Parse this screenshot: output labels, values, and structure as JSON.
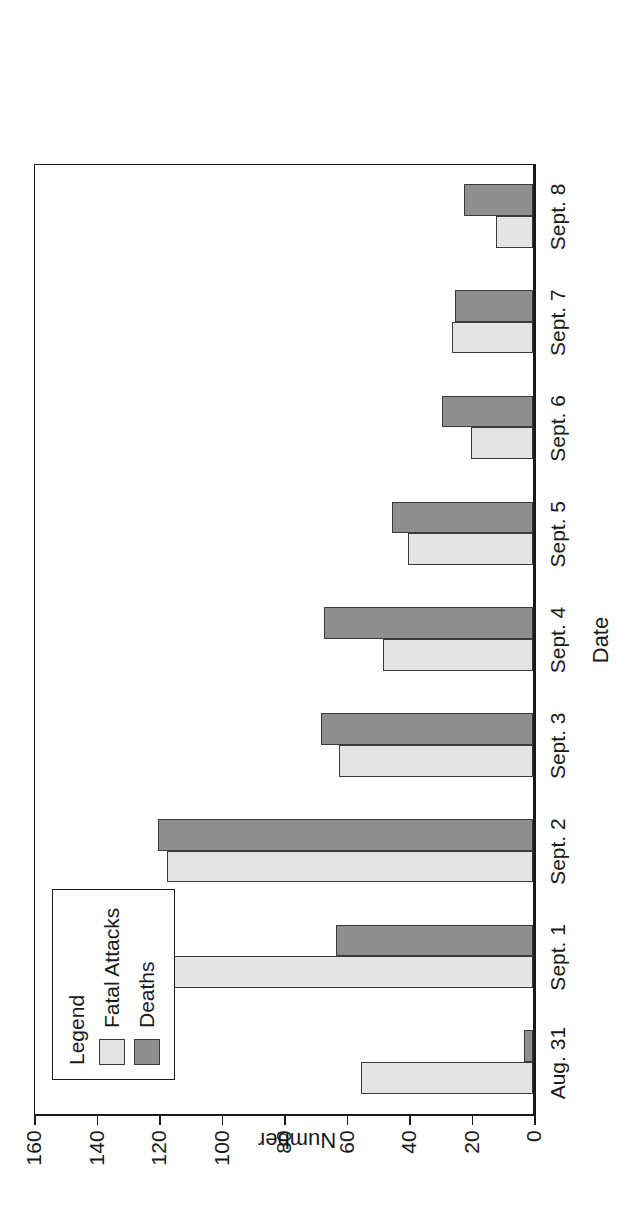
{
  "chart_data": {
    "type": "bar",
    "orientation": "vertical-grouped-rotated",
    "title": "",
    "xlabel": "Date",
    "ylabel": "Number",
    "ylim": [
      0,
      160
    ],
    "yticks": [
      0,
      20,
      40,
      60,
      80,
      100,
      120,
      140,
      160
    ],
    "ytick_labels": [
      "0",
      "20",
      "40",
      "60",
      "80",
      "100",
      "120",
      "140",
      "160"
    ],
    "grid": false,
    "legend_position": "top-left",
    "categories": [
      "Aug. 31",
      "Sept. 1",
      "Sept. 2",
      "Sept. 3",
      "Sept. 4",
      "Sept. 5",
      "Sept. 6",
      "Sept. 7",
      "Sept. 8"
    ],
    "series": [
      {
        "name": "Fatal Attacks",
        "color": "#e4e4e4",
        "values": [
          55,
          140,
          117,
          62,
          48,
          40,
          20,
          26,
          12
        ]
      },
      {
        "name": "Deaths",
        "color": "#8e8e8e",
        "values": [
          3,
          63,
          120,
          68,
          67,
          45,
          29,
          25,
          22
        ]
      }
    ]
  },
  "legend": {
    "title": "Legend",
    "entries": [
      {
        "label": "Fatal Attacks",
        "color": "#e4e4e4"
      },
      {
        "label": "Deaths",
        "color": "#8e8e8e"
      }
    ]
  },
  "axes": {
    "x_title": "Date",
    "y_title": "Number"
  },
  "colors": {
    "attacks": "#e4e4e4",
    "deaths": "#8e8e8e",
    "outline": "#3a3a3a",
    "axis": "#1a1a1a",
    "background": "#ffffff"
  }
}
